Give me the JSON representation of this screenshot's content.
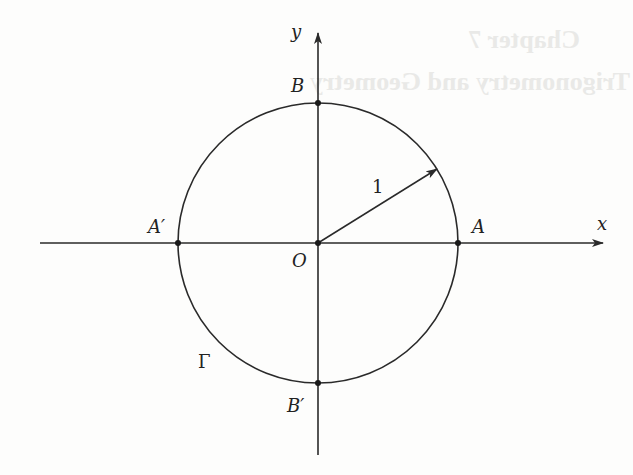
{
  "figure": {
    "type": "unit-circle",
    "colors": {
      "stroke": "#2a2a2a",
      "background": "#fdfdfc",
      "bleed_through": "#e9e9e7"
    },
    "bleed_through_text": [
      "Chapter 7",
      "Trigonometry and Geometry"
    ],
    "axes": {
      "x_label": "x",
      "y_label": "y"
    },
    "points": {
      "origin": "O",
      "A": "A",
      "A_prime": "A′",
      "B": "B",
      "B_prime": "B′"
    },
    "radius_label": "1",
    "circle_label": "Γ",
    "geometry": {
      "center": [
        318,
        243
      ],
      "radius_px": 140,
      "radius_angle_deg": 32
    }
  }
}
